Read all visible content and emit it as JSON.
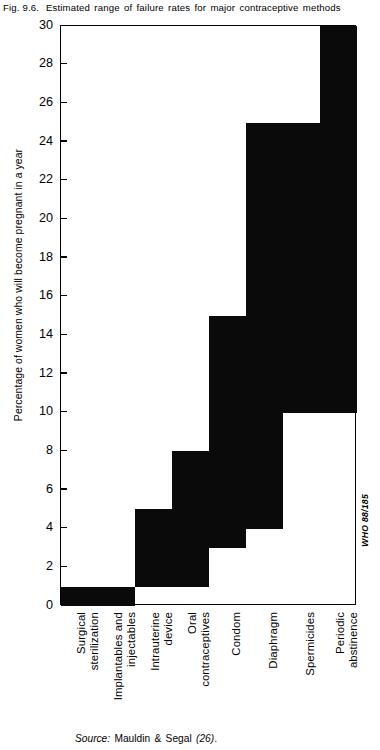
{
  "figure": {
    "number": "Fig. 9.6.",
    "title": "Estimated range of failure rates for major contraceptive methods",
    "reference_code": "WHO 88/185",
    "source_label": "Source:",
    "source_text": "Mauldin & Segal",
    "source_ref": "(26)",
    "source_end": "."
  },
  "chart_data": {
    "type": "bar",
    "variant": "floating-range-bar",
    "title": "Estimated range of failure rates for major contraceptive methods",
    "xlabel": "",
    "ylabel": "Percentage of women who will become pregnant in a year",
    "ylim": [
      0,
      30
    ],
    "ytick_step": 2,
    "yticks": [
      0,
      2,
      4,
      6,
      8,
      10,
      12,
      14,
      16,
      18,
      20,
      22,
      24,
      26,
      28,
      30
    ],
    "ytick_labels": [
      "0",
      "2",
      "4",
      "6",
      "8",
      "10",
      "12",
      "14",
      "16",
      "18",
      "20",
      "22",
      "24",
      "26",
      "28",
      "30"
    ],
    "grid": false,
    "legend": false,
    "bar_color": "#0a0a0a",
    "categories": [
      "Surgical sterilization",
      "Implantables and injectables",
      "Intrauterine device",
      "Oral contraceptives",
      "Condom",
      "Diaphragm",
      "Spermicides",
      "Periodic abstinence"
    ],
    "category_lines": [
      [
        "Surgical",
        "sterilization"
      ],
      [
        "Implantables and",
        "injectables"
      ],
      [
        "Intrauterine",
        "device"
      ],
      [
        "Oral",
        "contraceptives"
      ],
      [
        "Condom"
      ],
      [
        "Diaphragm"
      ],
      [
        "Spermicides"
      ],
      [
        "Periodic",
        "abstinence"
      ]
    ],
    "ranges": [
      {
        "category": "Surgical sterilization",
        "low": 0,
        "high": 1
      },
      {
        "category": "Implantables and injectables",
        "low": 0,
        "high": 1
      },
      {
        "category": "Intrauterine device",
        "low": 1,
        "high": 5
      },
      {
        "category": "Oral contraceptives",
        "low": 1,
        "high": 8
      },
      {
        "category": "Condom",
        "low": 3,
        "high": 15
      },
      {
        "category": "Diaphragm",
        "low": 4,
        "high": 25
      },
      {
        "category": "Spermicides",
        "low": 10,
        "high": 25
      },
      {
        "category": "Periodic abstinence",
        "low": 10,
        "high": 30
      }
    ],
    "low_values": [
      0,
      0,
      1,
      1,
      3,
      4,
      10,
      10
    ],
    "high_values": [
      1,
      1,
      5,
      8,
      15,
      25,
      25,
      30
    ]
  }
}
